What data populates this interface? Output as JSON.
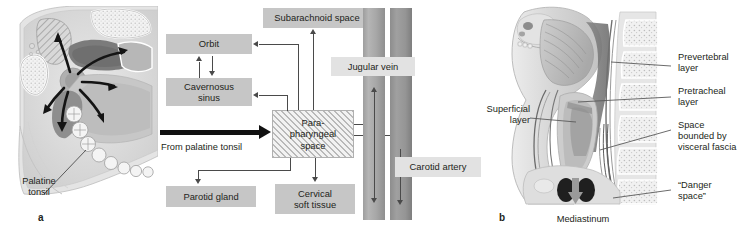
{
  "figure": {
    "panel_a": {
      "letter": "a",
      "labels": [
        {
          "id": "palatine-tonsil",
          "text": "Palatine\ntonsil"
        }
      ]
    },
    "flowchart": {
      "source_arrow_label": "From palatine tonsil",
      "boxes": [
        {
          "id": "subarachnoid-space",
          "label": "Subarachnoid  space",
          "style": "solid"
        },
        {
          "id": "orbit",
          "label": "Orbit",
          "style": "solid"
        },
        {
          "id": "cavernosus-sinus",
          "label": "Cavernosus\nsinus",
          "style": "solid"
        },
        {
          "id": "parapharyngeal-space",
          "label": "Para-\npharyngeal\nspace",
          "style": "hatched"
        },
        {
          "id": "parotid-gland",
          "label": "Parotid gland",
          "style": "solid"
        },
        {
          "id": "cervical-soft-tissue",
          "label": "Cervical\nsoft tissue",
          "style": "solid"
        },
        {
          "id": "jugular-vein",
          "label": "Jugular vein",
          "style": "light"
        },
        {
          "id": "carotid-artery",
          "label": "Carotid artery",
          "style": "light"
        }
      ]
    },
    "panel_b": {
      "letter": "b",
      "labels": [
        {
          "id": "prevertebral-layer",
          "text": "Prevertebral\nlayer"
        },
        {
          "id": "pretracheal-layer",
          "text": "Pretracheal\nlayer"
        },
        {
          "id": "space-visceral-fascia",
          "text": "Space\nbounded by\nvisceral fascia"
        },
        {
          "id": "danger-space",
          "text": "“Danger\nspace”"
        },
        {
          "id": "superficial-layer",
          "text": "Superficial\nlayer"
        },
        {
          "id": "mediastinum",
          "text": "Mediastinum"
        }
      ]
    },
    "colors": {
      "box_fill": "#c6c6c6",
      "box_fill_light": "#e2e2e2",
      "line": "#4a4a4a",
      "thick_arrow": "#111111",
      "vessel": "#a7a7a7",
      "text": "#231f20"
    }
  }
}
